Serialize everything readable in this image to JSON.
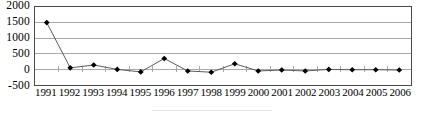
{
  "chart_data": {
    "type": "line",
    "title": "",
    "subtitle": "",
    "xlabel": "",
    "ylabel": "",
    "categories": [
      "1991",
      "1992",
      "1993",
      "1994",
      "1995",
      "1996",
      "1997",
      "1998",
      "1999",
      "2000",
      "2001",
      "2002",
      "2003",
      "2004",
      "2005",
      "2006"
    ],
    "series": [
      {
        "name": "series-1",
        "values": [
          1500,
          50,
          140,
          0,
          -80,
          350,
          -50,
          -90,
          180,
          -50,
          -20,
          -50,
          0,
          -10,
          -10,
          -20
        ]
      }
    ],
    "ylim": [
      -500,
      2000
    ],
    "yticks": [
      2000,
      1500,
      1000,
      500,
      0,
      -500
    ],
    "ytick_labels": [
      "2000",
      "1500",
      "1000",
      "500",
      "0",
      "-500"
    ],
    "xtick_labels": [
      "1991",
      "1992",
      "1993",
      "1994",
      "1995",
      "1996",
      "1997",
      "1998",
      "1999",
      "2000",
      "2001",
      "2002",
      "2003",
      "2004",
      "2005",
      "2006"
    ],
    "grid": true,
    "grid_axis": "y",
    "legend": false,
    "legend_position": "bottom",
    "marker": "diamond",
    "marker_color": "#000000",
    "line_color": "#585858",
    "grid_color": "#a8a8a8",
    "axis_color": "#4a4a4a",
    "background": "#ffffff"
  }
}
